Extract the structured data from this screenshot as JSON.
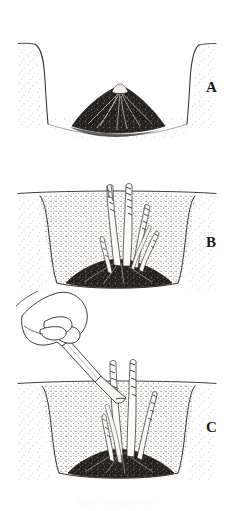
{
  "figure": {
    "background_color": "#ffffff",
    "ink_color": "#2b2b2b",
    "soil_fill_color": "#cfcac2",
    "crown_color": "#1e1c1a",
    "caption": "Figure. Asparagus trench"
  },
  "panels": [
    {
      "id": "A",
      "label": "A",
      "description": "Open V-shaped trench with asparagus crown and spread roots mounded on the trench floor"
    },
    {
      "id": "B",
      "label": "B",
      "description": "Trench partly filled with soil; asparagus spears growing up from the crown toward the surface"
    },
    {
      "id": "C",
      "label": "C",
      "description": "Hand holding a knife cutting an asparagus spear at ground level in the filled trench"
    }
  ],
  "elements": {
    "ground_line_label": "ground surface line",
    "trench_label": "trench wall",
    "crown_label": "asparagus crown and roots",
    "spear_label": "asparagus spear",
    "hand_label": "hand",
    "knife_label": "harvest knife"
  }
}
